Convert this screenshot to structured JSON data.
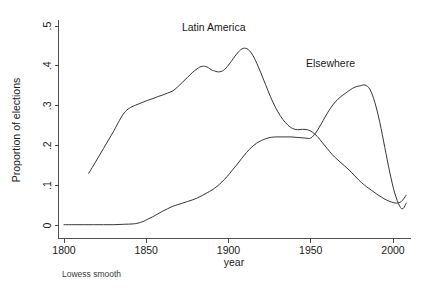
{
  "chart_data": {
    "type": "line",
    "title": "",
    "xlabel": "year",
    "ylabel": "Proportion of elections",
    "caption": "Lowess smooth",
    "xlim": [
      1800,
      2010
    ],
    "ylim": [
      0,
      0.5
    ],
    "grid": false,
    "legend_position": "inline-annotations",
    "xticks": [
      "1800",
      "1850",
      "1900",
      "1950",
      "2000"
    ],
    "xtick_values": [
      1800,
      1850,
      1900,
      1950,
      2000
    ],
    "yticks": [
      "0",
      ".1",
      ".2",
      ".3",
      ".4",
      ".5"
    ],
    "ytick_values": [
      0,
      0.1,
      0.2,
      0.3,
      0.4,
      0.5
    ],
    "series": [
      {
        "name": "Latin America",
        "label_x": 1891,
        "label_y": 0.487,
        "x": [
          1815,
          1818,
          1821,
          1824,
          1827,
          1830,
          1833,
          1836,
          1839,
          1842,
          1845,
          1848,
          1851,
          1854,
          1857,
          1860,
          1863,
          1866,
          1869,
          1872,
          1875,
          1878,
          1881,
          1884,
          1887,
          1890,
          1891,
          1894,
          1897,
          1900,
          1903,
          1906,
          1909,
          1912,
          1915,
          1918,
          1921,
          1924,
          1927,
          1930,
          1933,
          1936,
          1939,
          1942,
          1945,
          1948,
          1951,
          1954,
          1957,
          1960,
          1963,
          1966,
          1969,
          1972,
          1975,
          1978,
          1981,
          1984,
          1987,
          1990,
          1993,
          1996,
          1999,
          2002,
          2005,
          2008
        ],
        "y": [
          0.131,
          0.151,
          0.172,
          0.193,
          0.214,
          0.235,
          0.258,
          0.279,
          0.292,
          0.299,
          0.304,
          0.309,
          0.314,
          0.318,
          0.323,
          0.327,
          0.332,
          0.337,
          0.347,
          0.359,
          0.371,
          0.383,
          0.393,
          0.399,
          0.397,
          0.389,
          0.388,
          0.385,
          0.389,
          0.402,
          0.419,
          0.435,
          0.444,
          0.441,
          0.425,
          0.399,
          0.369,
          0.338,
          0.309,
          0.285,
          0.266,
          0.252,
          0.243,
          0.24,
          0.241,
          0.24,
          0.234,
          0.223,
          0.208,
          0.193,
          0.178,
          0.166,
          0.155,
          0.144,
          0.132,
          0.119,
          0.107,
          0.097,
          0.088,
          0.079,
          0.071,
          0.064,
          0.059,
          0.056,
          0.06,
          0.076
        ]
      },
      {
        "name": "Elsewhere",
        "label_x": 1962,
        "label_y": 0.396,
        "x": [
          1800,
          1806,
          1812,
          1818,
          1824,
          1830,
          1836,
          1842,
          1845,
          1848,
          1851,
          1854,
          1857,
          1860,
          1863,
          1866,
          1869,
          1872,
          1875,
          1878,
          1881,
          1884,
          1887,
          1890,
          1893,
          1896,
          1899,
          1902,
          1905,
          1908,
          1911,
          1914,
          1917,
          1920,
          1923,
          1926,
          1929,
          1932,
          1935,
          1938,
          1941,
          1944,
          1947,
          1950,
          1953,
          1956,
          1959,
          1962,
          1965,
          1968,
          1971,
          1974,
          1977,
          1980,
          1983,
          1986,
          1989,
          1992,
          1995,
          1998,
          2001,
          2004,
          2006,
          2008
        ],
        "y": [
          0.002,
          0.002,
          0.002,
          0.002,
          0.002,
          0.002,
          0.003,
          0.004,
          0.006,
          0.01,
          0.016,
          0.022,
          0.029,
          0.036,
          0.042,
          0.048,
          0.052,
          0.056,
          0.06,
          0.064,
          0.069,
          0.075,
          0.082,
          0.089,
          0.098,
          0.109,
          0.122,
          0.137,
          0.152,
          0.168,
          0.183,
          0.196,
          0.206,
          0.213,
          0.218,
          0.221,
          0.222,
          0.222,
          0.222,
          0.222,
          0.221,
          0.22,
          0.219,
          0.219,
          0.232,
          0.252,
          0.274,
          0.294,
          0.31,
          0.322,
          0.331,
          0.34,
          0.347,
          0.35,
          0.352,
          0.341,
          0.308,
          0.258,
          0.196,
          0.134,
          0.082,
          0.049,
          0.042,
          0.056
        ]
      }
    ]
  }
}
